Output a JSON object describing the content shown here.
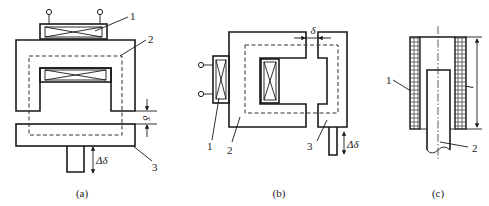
{
  "figure": {
    "panels": [
      {
        "id": "a",
        "caption": "(a)",
        "type": "variable air-gap thickness sensor",
        "labels": {
          "coil": "1",
          "core": "2",
          "armature": "3"
        },
        "symbols": {
          "gap": "δ",
          "displacement": "Δδ"
        }
      },
      {
        "id": "b",
        "caption": "(b)",
        "type": "variable air-gap area sensor",
        "labels": {
          "coil": "1",
          "core": "2",
          "armature": "3"
        },
        "symbols": {
          "gap": "δ",
          "displacement": "Δδ"
        }
      },
      {
        "id": "c",
        "caption": "(c)",
        "type": "solenoid (plunger) sensor",
        "labels": {
          "coil": "1",
          "plunger": "2"
        },
        "symbols": {
          "length": "l"
        }
      }
    ]
  }
}
